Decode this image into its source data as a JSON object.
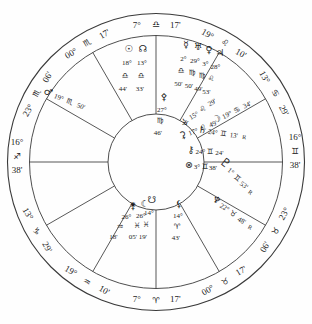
{
  "chart_data": {
    "type": "natal-wheel",
    "retro_label": "R",
    "colors": {
      "ink": "#1c1c1c",
      "line": "#3a3a3a",
      "bg": "#fefefe"
    },
    "layout": {
      "center": [
        156,
        162
      ],
      "outer_r": 148.5,
      "band_r": 126.5,
      "inner_r": 48,
      "label_r": 138
    },
    "cusps": [
      {
        "house": 10,
        "theta": 90,
        "deg": "7°",
        "sign": "libra",
        "glyph": "♎",
        "min": "17'"
      },
      {
        "house": 11,
        "theta": 120,
        "deg": "00°",
        "sign": "scorpio",
        "glyph": "♏",
        "min": "17'"
      },
      {
        "house": 12,
        "theta": 150,
        "deg": "23°",
        "sign": "scorpio",
        "glyph": "♏",
        "min": "06'"
      },
      {
        "house": 1,
        "theta": 180,
        "deg": "16°",
        "sign": "sagittarius",
        "glyph": "♐",
        "min": "38'"
      },
      {
        "house": 2,
        "theta": 210,
        "deg": "13°",
        "sign": "capricorn",
        "glyph": "♑",
        "min": "29'"
      },
      {
        "house": 3,
        "theta": 240,
        "deg": "19°",
        "sign": "aquarius",
        "glyph": "♒",
        "min": "10'"
      },
      {
        "house": 4,
        "theta": 270,
        "deg": "7°",
        "sign": "aries",
        "glyph": "♈",
        "min": "17'"
      },
      {
        "house": 5,
        "theta": 300,
        "deg": "00°",
        "sign": "taurus",
        "glyph": "♉",
        "min": "17'"
      },
      {
        "house": 6,
        "theta": 330,
        "deg": "23°",
        "sign": "taurus",
        "glyph": "♉",
        "min": "06'"
      },
      {
        "house": 7,
        "theta": 0,
        "deg": "16°",
        "sign": "gemini",
        "glyph": "♊",
        "min": "38'"
      },
      {
        "house": 8,
        "theta": 30,
        "deg": "13°",
        "sign": "cancer",
        "glyph": "♋",
        "min": "29'"
      },
      {
        "house": 9,
        "theta": 60,
        "deg": "19°",
        "sign": "leo",
        "glyph": "♌",
        "min": "10'"
      }
    ],
    "points": [
      {
        "name": "sun",
        "glyph": "☉",
        "deg": "18°",
        "sign": "♎",
        "min": "44'",
        "retro": false,
        "x": 129,
        "y": 52,
        "dx": -2,
        "dy": 13
      },
      {
        "name": "north-node",
        "glyph": "☊",
        "deg": "13°",
        "sign": "♎",
        "min": "33'",
        "retro": false,
        "x": 143,
        "y": 52,
        "dx": -1,
        "dy": 13
      },
      {
        "name": "mercury",
        "glyph": "☿",
        "deg": "2°",
        "sign": "♎",
        "min": "50'",
        "retro": false,
        "x": 186,
        "y": 48,
        "dx": -2.5,
        "dy": 12.5
      },
      {
        "name": "uranus",
        "glyph": "♅",
        "deg": "29°",
        "sign": "♍",
        "min": "50'",
        "retro": false,
        "x": 198,
        "y": 50,
        "dx": -3,
        "dy": 12.5
      },
      {
        "name": "venus",
        "glyph": "♀",
        "deg": "3°",
        "sign": "♍",
        "min": "49'",
        "retro": false,
        "x": 209,
        "y": 53,
        "dx": -3.5,
        "dy": 12.5
      },
      {
        "name": "jupiter",
        "glyph": "♃",
        "deg": "28°",
        "sign": "♌",
        "min": "53'",
        "retro": false,
        "x": 220,
        "y": 56,
        "dx": -4.5,
        "dy": 12.5
      },
      {
        "name": "pallas",
        "glyph": "⚴",
        "deg": "27°",
        "sign": "♍",
        "min": "46'",
        "retro": false,
        "x": 164,
        "y": 100,
        "dx": -2,
        "dy": 11.5
      },
      {
        "name": "vesta",
        "glyph": "⚶",
        "deg": "15°",
        "sign": "♌",
        "min": "29'",
        "retro": false,
        "x": 186,
        "y": 124,
        "dx": 9,
        "dy": -6.5,
        "rot": -30
      },
      {
        "name": "ceres",
        "glyph": "⚳",
        "deg": "17°",
        "sign": "♌",
        "min": "49'",
        "retro": false,
        "x": 184,
        "y": 138,
        "dx": 10,
        "dy": -4,
        "rot": -22
      },
      {
        "name": "moon",
        "glyph": "☽",
        "deg": "19°",
        "sign": "♋",
        "min": "34'",
        "retro": false,
        "x": 218,
        "y": 122,
        "dx": 10,
        "dy": -5,
        "rot": -26
      },
      {
        "name": "saturn",
        "glyph": "♄",
        "deg": "24°",
        "sign": "♊",
        "min": "13'",
        "retro": true,
        "x": 202,
        "y": 133,
        "dx": 10.5,
        "dy": 1.5,
        "rot": 8
      },
      {
        "name": "chiron",
        "glyph": "⚷",
        "deg": "24°",
        "sign": "♊",
        "min": "24'",
        "retro": false,
        "x": 191,
        "y": 153,
        "dx": 9.5,
        "dy": 0.5
      },
      {
        "name": "fortune",
        "glyph": "⊗",
        "deg": "3°",
        "sign": "♊",
        "min": "38'",
        "retro": false,
        "x": 189,
        "y": 168,
        "dx": 8,
        "dy": 0.5
      },
      {
        "name": "pluto",
        "glyph": "♇",
        "deg": "1°",
        "sign": "♊",
        "min": "53'",
        "retro": true,
        "x": 223,
        "y": 166,
        "dx": 6.5,
        "dy": 7,
        "rot": 38,
        "big": true
      },
      {
        "name": "neptune",
        "glyph": "♆",
        "deg": "22°",
        "sign": "♉",
        "min": "48'",
        "retro": true,
        "x": 215,
        "y": 203,
        "dx": 8.5,
        "dy": 6.5,
        "rot": 30
      },
      {
        "name": "lilith",
        "glyph": "⚸",
        "deg": "14°",
        "sign": "♈",
        "min": "43'",
        "retro": false,
        "x": 179,
        "y": 207,
        "dx": -1,
        "dy": 11
      },
      {
        "name": "south-point",
        "glyph": "☋",
        "deg": "14°",
        "sign": "♓",
        "min": "19'",
        "retro": false,
        "x": 152,
        "y": 203,
        "dx": -3,
        "dy": 12
      },
      {
        "name": "dark-moon",
        "glyph": "☾",
        "deg": "26°",
        "sign": "♓",
        "min": "05'",
        "retro": false,
        "x": 145,
        "y": 207,
        "dx": -4,
        "dy": 10.5
      },
      {
        "name": "juno",
        "glyph": "⚵",
        "deg": "26°",
        "sign": "♒",
        "min": "18'",
        "retro": false,
        "x": 133,
        "y": 209,
        "dx": -6.5,
        "dy": 10
      },
      {
        "name": "mars",
        "glyph": "♂",
        "deg": "19°",
        "sign": "♏",
        "min": "50'",
        "retro": false,
        "x": 47,
        "y": 95,
        "dx": 11,
        "dy": 4.5,
        "rot": 21
      }
    ]
  }
}
